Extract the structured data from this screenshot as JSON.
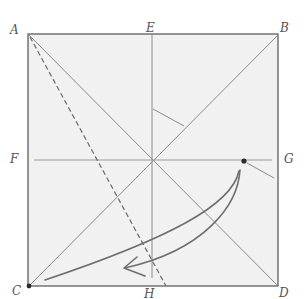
{
  "diagram": {
    "type": "origami-fold-diagram",
    "labels": {
      "A": "A",
      "E": "E",
      "B": "B",
      "F": "F",
      "G": "G",
      "C": "C",
      "H": "H",
      "D": "D"
    },
    "colors": {
      "paper": "#f1f1f1",
      "edge": "#6a6a6a",
      "crease": "#8a8a8a",
      "arrow": "#6e6e6e",
      "dot": "#2a2a2a",
      "label": "#555555"
    },
    "square": {
      "x1": 28,
      "y1": 34,
      "x2": 278,
      "y2": 286
    },
    "points": {
      "A": [
        28,
        34
      ],
      "B": [
        278,
        34
      ],
      "C": [
        29,
        286
      ],
      "D": [
        278,
        286
      ],
      "E": [
        152,
        34
      ],
      "F": [
        28,
        160
      ],
      "G": [
        278,
        160
      ],
      "H": [
        152,
        286
      ],
      "dot_near_G": [
        244,
        161
      ]
    },
    "lines": [
      {
        "name": "diagonal-A-D",
        "from": "A",
        "to": "D",
        "style": "solid"
      },
      {
        "name": "diagonal-B-C",
        "from": "B",
        "to": "C",
        "style": "solid"
      },
      {
        "name": "vertical-E-H",
        "from": "E",
        "to": "H",
        "style": "solid"
      },
      {
        "name": "horizontal-F-G",
        "from": "F",
        "to": "G",
        "style": "solid"
      },
      {
        "name": "dashed-A-to-bottom",
        "from": [
          28,
          34
        ],
        "to": [
          166,
          286
        ],
        "style": "dashed"
      }
    ],
    "arrow": {
      "from": "dot_near_G",
      "to": "C",
      "style": "curved"
    }
  }
}
